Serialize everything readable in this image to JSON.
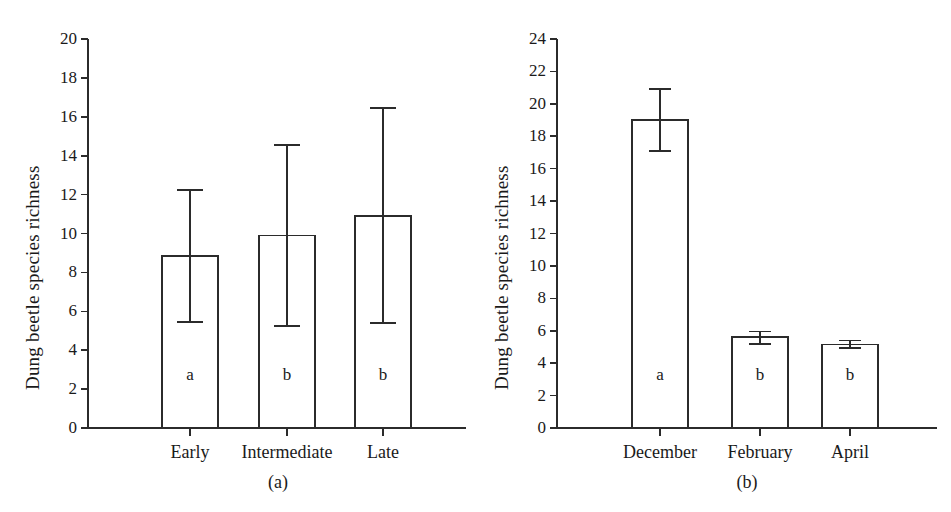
{
  "figure": {
    "background": "#ffffff",
    "ink_color": "#2b2b2b",
    "axis_title": "Dung beetle species  richness"
  },
  "panels": [
    {
      "caption": "(a)",
      "axis_title": "Dung beetle species  richness",
      "y_ticks": [
        "0",
        "2",
        "4",
        "6",
        "8",
        "10",
        "12",
        "14",
        "16",
        "18",
        "20"
      ],
      "x_labels": [
        "Early",
        "Intermediate",
        "Late"
      ],
      "letters": [
        "a",
        "b",
        "b"
      ]
    },
    {
      "caption": "(b)",
      "axis_title": "Dung beetle species  richness",
      "y_ticks": [
        "0",
        "2",
        "4",
        "6",
        "8",
        "10",
        "12",
        "14",
        "16",
        "18",
        "20",
        "22",
        "24"
      ],
      "x_labels": [
        "December",
        "February",
        "April"
      ],
      "letters": [
        "a",
        "b",
        "b"
      ]
    }
  ],
  "chart_data": [
    {
      "type": "bar",
      "panel": "(a)",
      "title": "",
      "xlabel": "",
      "ylabel": "Dung beetle species  richness",
      "categories": [
        "Early",
        "Intermediate",
        "Late"
      ],
      "values": [
        8.85,
        9.9,
        10.9
      ],
      "error_upper": [
        12.25,
        14.55,
        16.45
      ],
      "error_lower": [
        5.45,
        5.25,
        5.4
      ],
      "point_labels": [
        "a",
        "b",
        "b"
      ],
      "ylim": [
        0,
        20
      ],
      "ytick_step": 2,
      "grid": false,
      "legend": "none"
    },
    {
      "type": "bar",
      "panel": "(b)",
      "title": "",
      "xlabel": "",
      "ylabel": "Dung beetle species  richness",
      "categories": [
        "December",
        "February",
        "April"
      ],
      "values": [
        19.0,
        5.6,
        5.15
      ],
      "error_upper": [
        20.9,
        5.95,
        5.4
      ],
      "error_lower": [
        17.1,
        5.2,
        4.95
      ],
      "point_labels": [
        "a",
        "b",
        "b"
      ],
      "ylim": [
        0,
        24
      ],
      "ytick_step": 2,
      "grid": false,
      "legend": "none"
    }
  ]
}
